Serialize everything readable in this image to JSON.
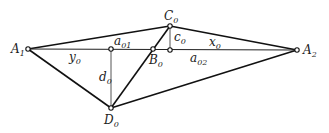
{
  "diagram": {
    "colors": {
      "background": "#ffffff",
      "line": "#111111",
      "thin_line": "#444444",
      "text": "#222222"
    },
    "points": {
      "A1": {
        "x": 28,
        "y": 49,
        "label": "A",
        "sub": "1"
      },
      "A2": {
        "x": 297,
        "y": 50,
        "label": "A",
        "sub": "2"
      },
      "C0": {
        "x": 170,
        "y": 26,
        "label": "C",
        "sub": "0"
      },
      "B0": {
        "x": 153,
        "y": 49,
        "label": "B",
        "sub": "0"
      },
      "D0": {
        "x": 111,
        "y": 108,
        "label": "D",
        "sub": "0"
      },
      "P01": {
        "x": 111,
        "y": 49
      },
      "P02": {
        "x": 170,
        "y": 50
      }
    },
    "segment_labels": {
      "a01": {
        "label": "a",
        "sub": "01"
      },
      "a02": {
        "label": "a",
        "sub": "02"
      },
      "y0": {
        "label": "y",
        "sub": "0"
      },
      "x0": {
        "label": "x",
        "sub": "0"
      },
      "c0": {
        "label": "c",
        "sub": "0"
      },
      "d0": {
        "label": "d",
        "sub": "0"
      }
    }
  }
}
